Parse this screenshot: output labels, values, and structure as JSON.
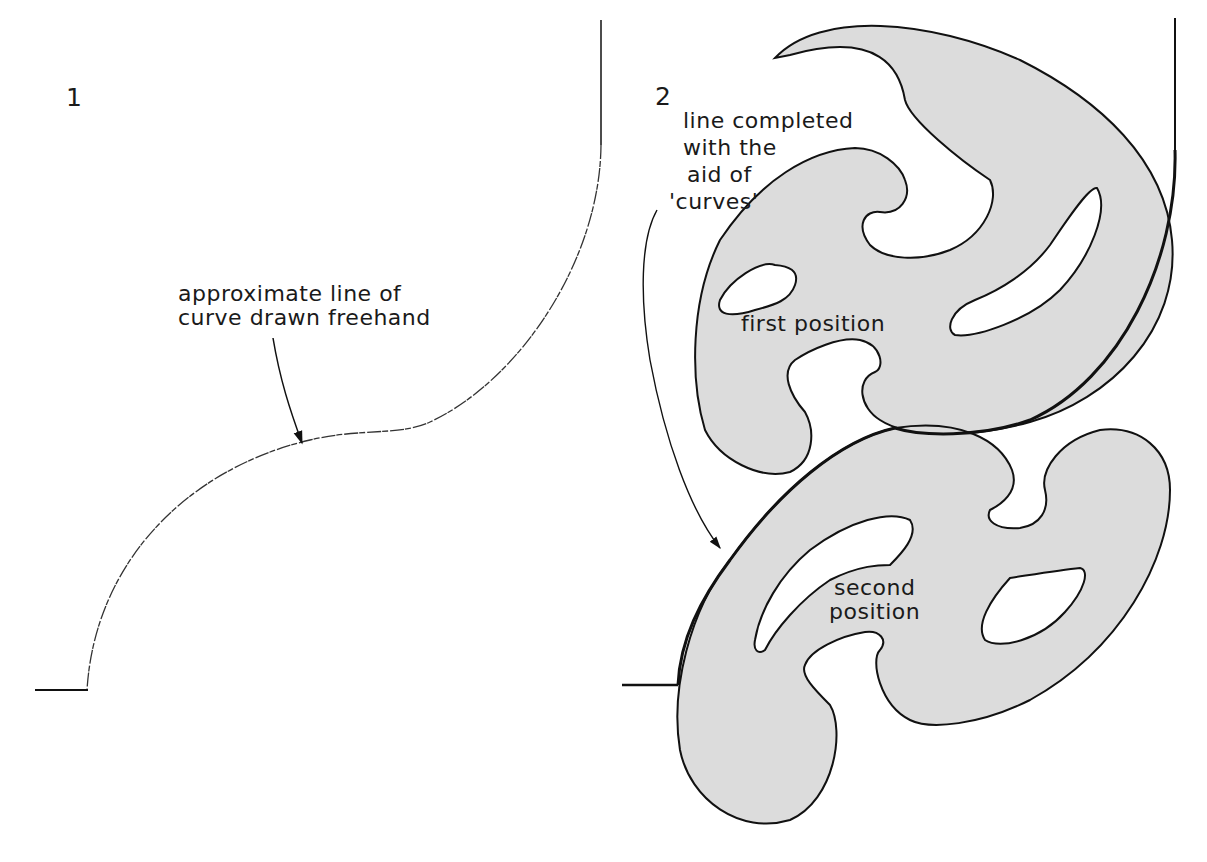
{
  "figure1": {
    "number": "1",
    "annotation_line1": "approximate line of",
    "annotation_line2": "curve drawn freehand"
  },
  "figure2": {
    "number": "2",
    "annotation_line1": "line completed",
    "annotation_line2": "with the",
    "annotation_line3": "aid of",
    "annotation_line4": "'curves'",
    "first_label": "first position",
    "second_label_line1": "second",
    "second_label_line2": "position"
  },
  "colors": {
    "ink": "#111111",
    "template_fill": "#dcdcdc",
    "background": "#ffffff"
  }
}
